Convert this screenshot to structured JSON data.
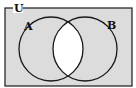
{
  "diagram": {
    "type": "venn",
    "universe_label": "U",
    "sets": [
      {
        "label": "A"
      },
      {
        "label": "B"
      }
    ],
    "shaded_region": "complement of A∩B",
    "unshaded_region": "A∩B",
    "colors": {
      "shade": "#dcdcdc",
      "unshaded": "#ffffff",
      "stroke": "#1a1a1a"
    }
  }
}
